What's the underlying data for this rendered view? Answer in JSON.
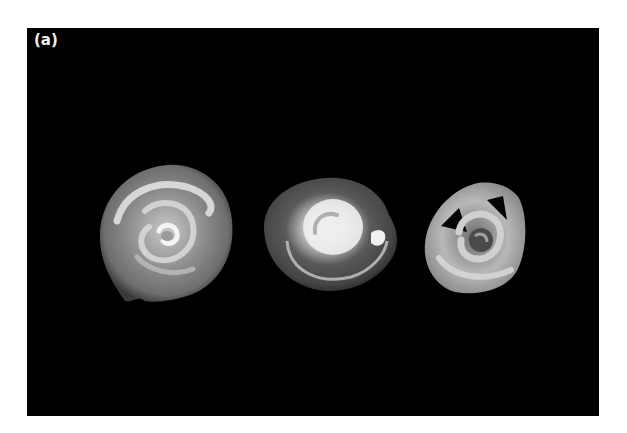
{
  "figure": {
    "panel_label": "(a)",
    "background_color": "#000000",
    "frame_color": "#ffffff",
    "shells": [
      {
        "position": "left",
        "description": "large flat planispiral shell, grey with white spiral bands"
      },
      {
        "position": "center",
        "description": "rounded shell with bright white inner whorl"
      },
      {
        "position": "right",
        "description": "smaller, angular, broken coiled shell"
      }
    ]
  }
}
